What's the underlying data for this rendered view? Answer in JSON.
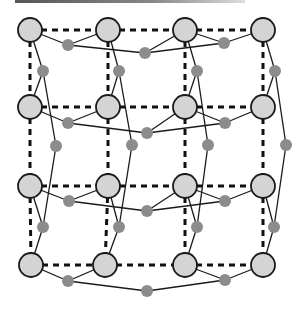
{
  "diagram": {
    "colors": {
      "large_node_fill": "#d4d4d4",
      "large_node_stroke": "#1a1a1a",
      "small_node_fill": "#8c8c8c",
      "dashed_edge": "#111111",
      "solid_edge": "#1a1a1a",
      "top_bar": "#666666"
    },
    "large_nodes": [
      {
        "id": "n00",
        "x": 30,
        "y": 30
      },
      {
        "id": "n01",
        "x": 108,
        "y": 30
      },
      {
        "id": "n02",
        "x": 185,
        "y": 30
      },
      {
        "id": "n03",
        "x": 263,
        "y": 30
      },
      {
        "id": "n10",
        "x": 30,
        "y": 107
      },
      {
        "id": "n11",
        "x": 108,
        "y": 107
      },
      {
        "id": "n12",
        "x": 185,
        "y": 107
      },
      {
        "id": "n13",
        "x": 263,
        "y": 107
      },
      {
        "id": "n20",
        "x": 30,
        "y": 186
      },
      {
        "id": "n21",
        "x": 108,
        "y": 186
      },
      {
        "id": "n22",
        "x": 185,
        "y": 186
      },
      {
        "id": "n23",
        "x": 263,
        "y": 186
      },
      {
        "id": "n30",
        "x": 31,
        "y": 265
      },
      {
        "id": "n31",
        "x": 105,
        "y": 265
      },
      {
        "id": "n32",
        "x": 185,
        "y": 265
      },
      {
        "id": "n33",
        "x": 263,
        "y": 265
      }
    ],
    "small_nodes": [
      {
        "id": "h0a",
        "x": 68,
        "y": 45
      },
      {
        "id": "h0b",
        "x": 145,
        "y": 53
      },
      {
        "id": "h0c",
        "x": 224,
        "y": 43
      },
      {
        "id": "v0a",
        "x": 43,
        "y": 71
      },
      {
        "id": "v0b",
        "x": 119,
        "y": 71
      },
      {
        "id": "v0c",
        "x": 197,
        "y": 71
      },
      {
        "id": "v0d",
        "x": 275,
        "y": 71
      },
      {
        "id": "h1a",
        "x": 68,
        "y": 123
      },
      {
        "id": "h1b",
        "x": 147,
        "y": 133
      },
      {
        "id": "h1c",
        "x": 225,
        "y": 123
      },
      {
        "id": "v1a",
        "x": 56,
        "y": 146
      },
      {
        "id": "v1b",
        "x": 132,
        "y": 145
      },
      {
        "id": "v1c",
        "x": 208,
        "y": 145
      },
      {
        "id": "v1d",
        "x": 286,
        "y": 145
      },
      {
        "id": "h2a",
        "x": 69,
        "y": 201
      },
      {
        "id": "h2b",
        "x": 147,
        "y": 211
      },
      {
        "id": "h2c",
        "x": 225,
        "y": 201
      },
      {
        "id": "v2a",
        "x": 43,
        "y": 227
      },
      {
        "id": "v2b",
        "x": 119,
        "y": 227
      },
      {
        "id": "v2c",
        "x": 197,
        "y": 227
      },
      {
        "id": "v2d",
        "x": 274,
        "y": 227
      },
      {
        "id": "h3a",
        "x": 68,
        "y": 281
      },
      {
        "id": "h3b",
        "x": 147,
        "y": 291
      },
      {
        "id": "h3c",
        "x": 225,
        "y": 280
      }
    ],
    "dashed_edges": [
      [
        "n00",
        "n01"
      ],
      [
        "n01",
        "n02"
      ],
      [
        "n02",
        "n03"
      ],
      [
        "n10",
        "n11"
      ],
      [
        "n11",
        "n12"
      ],
      [
        "n12",
        "n13"
      ],
      [
        "n20",
        "n21"
      ],
      [
        "n21",
        "n22"
      ],
      [
        "n22",
        "n23"
      ],
      [
        "n30",
        "n31"
      ],
      [
        "n31",
        "n32"
      ],
      [
        "n32",
        "n33"
      ],
      [
        "n00",
        "n10"
      ],
      [
        "n10",
        "n20"
      ],
      [
        "n20",
        "n30"
      ],
      [
        "n01",
        "n11"
      ],
      [
        "n11",
        "n21"
      ],
      [
        "n21",
        "n31"
      ],
      [
        "n02",
        "n12"
      ],
      [
        "n12",
        "n22"
      ],
      [
        "n22",
        "n32"
      ],
      [
        "n03",
        "n13"
      ],
      [
        "n13",
        "n23"
      ],
      [
        "n23",
        "n33"
      ]
    ],
    "solid_edges": [
      [
        "n00",
        "h0a"
      ],
      [
        "h0a",
        "n01"
      ],
      [
        "h0a",
        "h0b"
      ],
      [
        "h0b",
        "h0c"
      ],
      [
        "n02",
        "h0c"
      ],
      [
        "h0c",
        "n03"
      ],
      [
        "n02",
        "h0b"
      ],
      [
        "n10",
        "h1a"
      ],
      [
        "h1a",
        "n11"
      ],
      [
        "h1a",
        "h1b"
      ],
      [
        "h1b",
        "h1c"
      ],
      [
        "n12",
        "h1c"
      ],
      [
        "h1c",
        "n13"
      ],
      [
        "n12",
        "h1b"
      ],
      [
        "n20",
        "h2a"
      ],
      [
        "h2a",
        "n21"
      ],
      [
        "h2a",
        "h2b"
      ],
      [
        "h2b",
        "h2c"
      ],
      [
        "n22",
        "h2c"
      ],
      [
        "h2c",
        "n23"
      ],
      [
        "n22",
        "h2b"
      ],
      [
        "n30",
        "h3a"
      ],
      [
        "h3a",
        "n31"
      ],
      [
        "h3a",
        "h3b"
      ],
      [
        "h3b",
        "h3c"
      ],
      [
        "n32",
        "h3c"
      ],
      [
        "h3c",
        "n33"
      ],
      [
        "n00",
        "v0a"
      ],
      [
        "v0a",
        "n10"
      ],
      [
        "v0a",
        "v1a"
      ],
      [
        "n01",
        "v0b"
      ],
      [
        "v0b",
        "n11"
      ],
      [
        "v0b",
        "v1b"
      ],
      [
        "n02",
        "v0c"
      ],
      [
        "v0c",
        "n12"
      ],
      [
        "v0c",
        "v1c"
      ],
      [
        "n03",
        "v0d"
      ],
      [
        "v0d",
        "n13"
      ],
      [
        "v0d",
        "v1d"
      ],
      [
        "v1a",
        "v2a"
      ],
      [
        "v1b",
        "v2b"
      ],
      [
        "v1c",
        "v2c"
      ],
      [
        "v1d",
        "v2d"
      ],
      [
        "n20",
        "v2a"
      ],
      [
        "v2a",
        "n30"
      ],
      [
        "n21",
        "v2b"
      ],
      [
        "v2b",
        "n31"
      ],
      [
        "n22",
        "v2c"
      ],
      [
        "v2c",
        "n32"
      ],
      [
        "n23",
        "v2d"
      ],
      [
        "v2d",
        "n33"
      ]
    ],
    "large_radius": 12,
    "small_radius": 6
  }
}
